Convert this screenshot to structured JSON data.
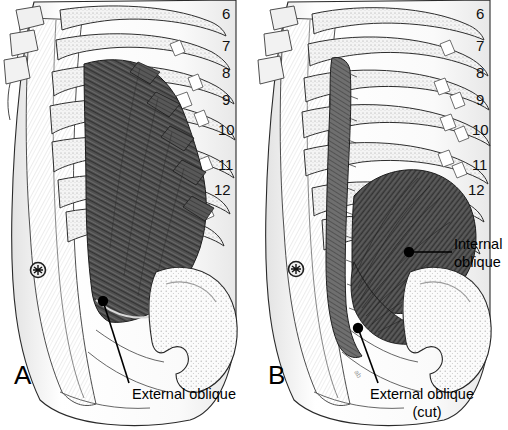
{
  "figure": {
    "background_color": "#ffffff",
    "ink_color": "#000000",
    "muscle_fill_dark": "#4a4a4a",
    "muscle_fill_mid": "#6e6e6e",
    "bone_fill": "#f2f2f2",
    "shadow_gray": "#b8b8b8"
  },
  "panels": [
    {
      "id": "A",
      "letter": "A",
      "letter_x": 14,
      "letter_y": 362,
      "description": "Superficial dissection showing external oblique muscle intact",
      "rib_numbers": [
        {
          "label": "6",
          "x": 222,
          "y": 6
        },
        {
          "label": "7",
          "x": 222,
          "y": 38
        },
        {
          "label": "8",
          "x": 222,
          "y": 65
        },
        {
          "label": "9",
          "x": 222,
          "y": 92
        },
        {
          "label": "10",
          "x": 222,
          "y": 122
        },
        {
          "label": "11",
          "x": 222,
          "y": 157
        },
        {
          "label": "12",
          "x": 222,
          "y": 182
        }
      ],
      "callouts": [
        {
          "name": "external-oblique",
          "lines": [
            "External oblique"
          ],
          "text_x": 132,
          "text_y": 386,
          "dot_x": 103,
          "dot_y": 301,
          "leader": [
            [
              103,
              301
            ],
            [
              128,
              382
            ]
          ]
        }
      ],
      "umbilicus": {
        "x": 38,
        "y": 270,
        "r": 8
      }
    },
    {
      "id": "B",
      "letter": "B",
      "letter_x": 268,
      "letter_y": 362,
      "description": "Deeper dissection with external oblique cut and reflected, exposing internal oblique",
      "rib_numbers": [
        {
          "label": "6",
          "x": 476,
          "y": 6
        },
        {
          "label": "7",
          "x": 476,
          "y": 38
        },
        {
          "label": "8",
          "x": 476,
          "y": 65
        },
        {
          "label": "9",
          "x": 476,
          "y": 92
        },
        {
          "label": "10",
          "x": 476,
          "y": 122
        },
        {
          "label": "11",
          "x": 476,
          "y": 157
        },
        {
          "label": "12",
          "x": 476,
          "y": 182
        }
      ],
      "callouts": [
        {
          "name": "internal-oblique",
          "lines": [
            "Internal",
            "oblique"
          ],
          "text_x": 454,
          "text_y": 236,
          "dot_x": 409,
          "dot_y": 252,
          "leader": [
            [
              409,
              252
            ],
            [
              450,
              252
            ]
          ]
        },
        {
          "name": "external-oblique-cut",
          "lines": [
            "External oblique",
            "(cut)"
          ],
          "text_x": 370,
          "text_y": 386,
          "dot_x": 358,
          "dot_y": 328,
          "leader": [
            [
              358,
              328
            ],
            [
              380,
              382
            ]
          ]
        }
      ],
      "umbilicus": {
        "x": 296,
        "y": 269,
        "r": 8
      }
    }
  ],
  "legend_notes": {
    "rib_series_start": 6,
    "rib_series_end": 12,
    "rib_count": 7
  }
}
